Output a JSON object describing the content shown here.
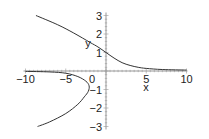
{
  "chart_data": {
    "type": "line",
    "title": "",
    "xlabel": "x",
    "ylabel": "y",
    "xlim": [
      -10,
      10
    ],
    "ylim": [
      -3,
      3
    ],
    "grid": false,
    "legend": null,
    "x_ticks": [
      -10,
      -5,
      0,
      5,
      10
    ],
    "y_ticks": [
      -3,
      -2,
      -1,
      0,
      1,
      2,
      3
    ],
    "x_tick_labels": [
      "-10",
      "-5",
      "0",
      "5",
      "10"
    ],
    "y_tick_labels": [
      "-3",
      "-2",
      "-1",
      "1",
      "2",
      "3"
    ],
    "series": [
      {
        "name": "upper branch",
        "points": [
          [
            -8.7,
            3.0
          ],
          [
            -6,
            2.5
          ],
          [
            -4,
            2.05
          ],
          [
            -2,
            1.55
          ],
          [
            -1,
            1.3
          ],
          [
            0,
            1.0
          ],
          [
            1,
            0.7
          ],
          [
            2,
            0.45
          ],
          [
            3,
            0.3
          ],
          [
            4,
            0.2
          ],
          [
            5,
            0.14
          ],
          [
            7,
            0.08
          ],
          [
            10,
            0.05
          ]
        ]
      },
      {
        "name": "lower branch",
        "points": [
          [
            -10,
            -0.02
          ],
          [
            -7,
            -0.05
          ],
          [
            -5,
            -0.12
          ],
          [
            -3.5,
            -0.3
          ],
          [
            -2.5,
            -0.55
          ],
          [
            -2.1,
            -0.8
          ],
          [
            -2.2,
            -1.1
          ],
          [
            -2.7,
            -1.4
          ],
          [
            -3.5,
            -1.8
          ],
          [
            -5,
            -2.3
          ],
          [
            -7,
            -2.75
          ],
          [
            -8.5,
            -3.0
          ]
        ]
      }
    ],
    "colors": {
      "curve": "#333333",
      "axis": "#999999",
      "text": "#222222"
    }
  }
}
